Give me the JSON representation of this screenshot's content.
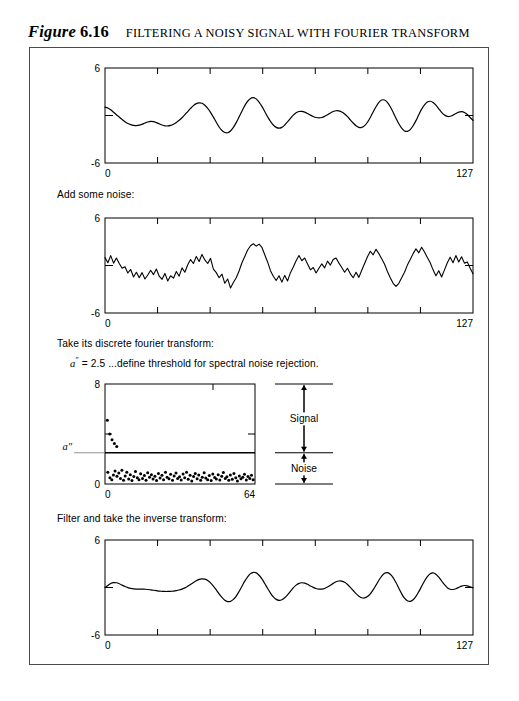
{
  "caption": {
    "label": "Figure",
    "number": "6.16",
    "title": "FILTERING A NOISY SIGNAL WITH FOURIER TRANSFORM"
  },
  "steps": {
    "noise": "Add some noise:",
    "dft": "Take its discrete fourier transform:",
    "threshold_prefix": "a",
    "threshold_mark": "″",
    "threshold_rest": " = 2.5 ...define threshold for spectral noise rejection.",
    "inverse": "Filter and take the inverse transform:"
  },
  "annotations": {
    "signal": "Signal",
    "noise": "Noise",
    "threshold_symbol": "a″"
  },
  "colors": {
    "frame": "#4a4a4a",
    "axis": "#000000",
    "trace": "#000000",
    "point": "#000000"
  },
  "chart_data": [
    {
      "id": "clean-signal",
      "type": "line",
      "title": "",
      "xlabel": "",
      "ylabel": "",
      "xlim": [
        0,
        127
      ],
      "ylim": [
        -6,
        6
      ],
      "xticks": [
        0,
        127
      ],
      "xticklabels": [
        "0",
        "127"
      ],
      "yticks": [
        -6,
        6
      ],
      "yticklabels": [
        "-6",
        "6"
      ],
      "grid": false,
      "interior_xticks": 6,
      "legend": "none",
      "y": [
        1.05,
        0.95,
        0.72,
        0.42,
        0.1,
        -0.2,
        -0.5,
        -0.78,
        -1.0,
        -1.15,
        -1.25,
        -1.28,
        -1.22,
        -1.1,
        -0.95,
        -0.82,
        -0.75,
        -0.78,
        -0.9,
        -1.05,
        -1.2,
        -1.3,
        -1.32,
        -1.25,
        -1.1,
        -0.88,
        -0.6,
        -0.28,
        0.1,
        0.5,
        0.9,
        1.25,
        1.5,
        1.6,
        1.55,
        1.3,
        0.9,
        0.4,
        -0.2,
        -0.85,
        -1.45,
        -1.9,
        -2.15,
        -2.18,
        -1.95,
        -1.5,
        -0.9,
        -0.2,
        0.55,
        1.25,
        1.8,
        2.15,
        2.25,
        2.1,
        1.7,
        1.15,
        0.5,
        -0.15,
        -0.75,
        -1.2,
        -1.5,
        -1.6,
        -1.5,
        -1.2,
        -0.8,
        -0.35,
        0.05,
        0.35,
        0.5,
        0.52,
        0.42,
        0.25,
        0.05,
        -0.12,
        -0.25,
        -0.3,
        -0.25,
        -0.1,
        0.1,
        0.32,
        0.5,
        0.6,
        0.58,
        0.45,
        0.2,
        -0.15,
        -0.55,
        -0.95,
        -1.3,
        -1.5,
        -1.5,
        -1.28,
        -0.85,
        -0.25,
        0.45,
        1.1,
        1.65,
        1.95,
        1.95,
        1.65,
        1.1,
        0.4,
        -0.35,
        -1.05,
        -1.6,
        -1.95,
        -2.0,
        -1.78,
        -1.3,
        -0.65,
        0.1,
        0.8,
        1.35,
        1.7,
        1.8,
        1.65,
        1.3,
        0.85,
        0.4,
        0.05,
        -0.12,
        -0.1,
        0.05,
        0.25,
        0.42,
        0.48,
        0.38,
        0.12,
        -0.25,
        -0.6
      ]
    },
    {
      "id": "noisy-signal",
      "type": "line",
      "title": "",
      "xlabel": "",
      "ylabel": "",
      "xlim": [
        0,
        127
      ],
      "ylim": [
        -6,
        6
      ],
      "xticks": [
        0,
        127
      ],
      "xticklabels": [
        "0",
        "127"
      ],
      "yticks": [
        -6,
        6
      ],
      "yticklabels": [
        "-6",
        "6"
      ],
      "grid": false,
      "interior_xticks": 6,
      "legend": "none",
      "y": [
        1.0,
        0.35,
        1.25,
        0.3,
        0.95,
        0.25,
        -0.35,
        -0.15,
        -0.95,
        -0.5,
        -1.45,
        -0.85,
        -1.55,
        -0.9,
        -1.7,
        -1.2,
        -0.6,
        -1.15,
        -0.45,
        -1.35,
        -1.75,
        -1.0,
        -1.95,
        -1.3,
        -1.6,
        -0.75,
        -1.35,
        -0.3,
        -0.85,
        0.1,
        0.75,
        0.25,
        1.15,
        0.5,
        1.4,
        0.7,
        0.25,
        0.9,
        -0.45,
        -0.9,
        -1.55,
        -1.1,
        -2.25,
        -1.7,
        -2.85,
        -2.15,
        -1.55,
        -0.7,
        0.35,
        1.15,
        1.95,
        2.5,
        2.75,
        2.45,
        2.7,
        2.3,
        1.35,
        0.45,
        -0.65,
        -1.35,
        -1.9,
        -1.3,
        -2.1,
        -1.25,
        -1.95,
        -0.9,
        -0.2,
        0.6,
        1.25,
        0.6,
        0.95,
        0.2,
        -0.55,
        -0.25,
        -0.95,
        -0.35,
        0.2,
        -0.3,
        0.55,
        0.05,
        0.75,
        0.95,
        0.3,
        -0.25,
        -0.85,
        -0.35,
        -1.05,
        -1.55,
        -0.85,
        -1.5,
        -0.6,
        0.25,
        1.1,
        1.8,
        1.35,
        2.05,
        1.5,
        0.85,
        0.15,
        -0.75,
        -1.55,
        -2.25,
        -2.65,
        -2.25,
        -1.55,
        -0.85,
        0.05,
        0.75,
        1.5,
        2.1,
        1.6,
        2.3,
        1.7,
        1.0,
        0.35,
        -0.55,
        -1.3,
        -0.65,
        -1.45,
        -0.55,
        0.35,
        1.05,
        0.35,
        1.25,
        0.45,
        1.1,
        0.3,
        0.45,
        -0.35,
        -1.05
      ]
    },
    {
      "id": "fourier-spectrum",
      "type": "scatter",
      "title": "",
      "xlabel": "",
      "ylabel": "",
      "xlim": [
        0,
        64
      ],
      "ylim": [
        0,
        8
      ],
      "xticks": [
        0,
        64
      ],
      "xticklabels": [
        "0",
        "64"
      ],
      "yticks": [
        0,
        8
      ],
      "yticklabels": [
        "0",
        "8"
      ],
      "grid": false,
      "threshold": 2.5,
      "legend": "none",
      "points": [
        [
          1.0,
          5.1
        ],
        [
          2.0,
          4.0
        ],
        [
          3.0,
          3.55
        ],
        [
          4.0,
          3.25
        ],
        [
          5.0,
          3.0
        ],
        [
          1.2,
          0.95
        ],
        [
          2.1,
          0.5
        ],
        [
          2.9,
          0.35
        ],
        [
          3.6,
          0.72
        ],
        [
          4.3,
          1.05
        ],
        [
          5.1,
          0.62
        ],
        [
          5.9,
          0.88
        ],
        [
          6.6,
          0.45
        ],
        [
          7.2,
          1.1
        ],
        [
          7.9,
          0.3
        ],
        [
          8.6,
          0.65
        ],
        [
          9.3,
          0.95
        ],
        [
          10.1,
          0.4
        ],
        [
          10.8,
          0.75
        ],
        [
          11.5,
          0.28
        ],
        [
          12.3,
          0.6
        ],
        [
          13.0,
          1.0
        ],
        [
          13.8,
          0.5
        ],
        [
          14.5,
          0.35
        ],
        [
          15.2,
          0.82
        ],
        [
          16.0,
          0.45
        ],
        [
          16.8,
          0.68
        ],
        [
          17.5,
          0.3
        ],
        [
          18.2,
          0.9
        ],
        [
          19.0,
          0.55
        ],
        [
          19.8,
          0.75
        ],
        [
          20.5,
          0.4
        ],
        [
          21.3,
          0.62
        ],
        [
          22.0,
          0.28
        ],
        [
          22.8,
          0.85
        ],
        [
          23.5,
          0.48
        ],
        [
          24.3,
          0.7
        ],
        [
          25.0,
          0.35
        ],
        [
          25.8,
          0.95
        ],
        [
          26.5,
          0.55
        ],
        [
          27.3,
          0.42
        ],
        [
          28.0,
          0.78
        ],
        [
          28.8,
          0.3
        ],
        [
          29.5,
          0.65
        ],
        [
          30.3,
          0.88
        ],
        [
          31.0,
          0.45
        ],
        [
          31.8,
          0.58
        ],
        [
          32.5,
          0.32
        ],
        [
          33.3,
          0.8
        ],
        [
          34.0,
          0.5
        ],
        [
          34.8,
          0.95
        ],
        [
          35.5,
          0.38
        ],
        [
          36.3,
          0.7
        ],
        [
          37.0,
          0.25
        ],
        [
          37.8,
          0.6
        ],
        [
          38.5,
          0.85
        ],
        [
          39.3,
          0.42
        ],
        [
          40.0,
          0.72
        ],
        [
          40.8,
          0.3
        ],
        [
          41.5,
          0.55
        ],
        [
          42.3,
          0.9
        ],
        [
          43.0,
          0.48
        ],
        [
          43.8,
          0.35
        ],
        [
          44.5,
          0.68
        ],
        [
          45.3,
          0.28
        ],
        [
          46.0,
          0.8
        ],
        [
          46.8,
          0.52
        ],
        [
          47.5,
          0.4
        ],
        [
          48.3,
          0.75
        ],
        [
          49.0,
          0.32
        ],
        [
          49.8,
          0.62
        ],
        [
          50.5,
          0.92
        ],
        [
          51.3,
          0.45
        ],
        [
          52.0,
          0.58
        ],
        [
          52.8,
          0.3
        ],
        [
          53.5,
          0.72
        ],
        [
          54.3,
          0.38
        ],
        [
          55.0,
          0.85
        ],
        [
          55.8,
          0.5
        ],
        [
          56.5,
          0.25
        ],
        [
          57.3,
          0.65
        ],
        [
          58.0,
          0.42
        ],
        [
          58.8,
          0.55
        ],
        [
          59.5,
          0.78
        ],
        [
          60.3,
          0.32
        ],
        [
          61.0,
          0.6
        ],
        [
          61.8,
          0.45
        ],
        [
          62.5,
          0.7
        ],
        [
          63.2,
          0.35
        ]
      ]
    },
    {
      "id": "filtered-signal",
      "type": "line",
      "title": "",
      "xlabel": "",
      "ylabel": "",
      "xlim": [
        0,
        127
      ],
      "ylim": [
        -6,
        6
      ],
      "xticks": [
        0,
        127
      ],
      "xticklabels": [
        "0",
        "127"
      ],
      "yticks": [
        -6,
        6
      ],
      "yticklabels": [
        "-6",
        "6"
      ],
      "grid": false,
      "interior_xticks": 6,
      "legend": "none",
      "y": [
        0.0,
        0.25,
        0.5,
        0.62,
        0.6,
        0.48,
        0.3,
        0.12,
        -0.02,
        -0.12,
        -0.18,
        -0.2,
        -0.2,
        -0.2,
        -0.22,
        -0.25,
        -0.3,
        -0.35,
        -0.4,
        -0.45,
        -0.48,
        -0.5,
        -0.5,
        -0.48,
        -0.45,
        -0.4,
        -0.32,
        -0.2,
        -0.05,
        0.15,
        0.38,
        0.62,
        0.85,
        1.02,
        1.1,
        1.05,
        0.88,
        0.58,
        0.18,
        -0.3,
        -0.8,
        -1.25,
        -1.6,
        -1.78,
        -1.75,
        -1.5,
        -1.08,
        -0.5,
        0.15,
        0.8,
        1.35,
        1.75,
        1.92,
        1.85,
        1.55,
        1.08,
        0.5,
        -0.12,
        -0.7,
        -1.18,
        -1.5,
        -1.62,
        -1.55,
        -1.3,
        -0.92,
        -0.48,
        -0.05,
        0.3,
        0.52,
        0.6,
        0.55,
        0.4,
        0.2,
        0.02,
        -0.12,
        -0.2,
        -0.2,
        -0.12,
        0.05,
        0.28,
        0.52,
        0.72,
        0.82,
        0.8,
        0.65,
        0.38,
        0.02,
        -0.38,
        -0.78,
        -1.1,
        -1.3,
        -1.32,
        -1.15,
        -0.8,
        -0.3,
        0.3,
        0.92,
        1.45,
        1.8,
        1.88,
        1.68,
        1.25,
        0.62,
        -0.1,
        -0.8,
        -1.35,
        -1.68,
        -1.75,
        -1.55,
        -1.12,
        -0.52,
        0.15,
        0.82,
        1.38,
        1.75,
        1.85,
        1.68,
        1.3,
        0.82,
        0.35,
        -0.02,
        -0.22,
        -0.25,
        -0.15,
        0.02,
        0.18,
        0.25,
        0.2,
        0.08,
        -0.05
      ]
    }
  ]
}
